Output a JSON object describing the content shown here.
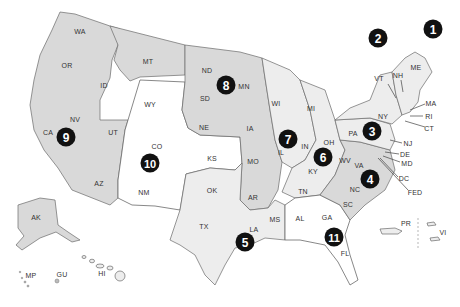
{
  "map": {
    "title": "",
    "colors": {
      "circuit_marker": "#111111",
      "shaded_region": "#d9d9d9",
      "light_region": "#ededed",
      "unshaded_region": "#ffffff"
    },
    "circuits": [
      {
        "id": "1",
        "label": "1",
        "x": 433,
        "y": 29
      },
      {
        "id": "2",
        "label": "2",
        "x": 378,
        "y": 38
      },
      {
        "id": "3",
        "label": "3",
        "x": 372,
        "y": 131
      },
      {
        "id": "4",
        "label": "4",
        "x": 370,
        "y": 179
      },
      {
        "id": "5",
        "label": "5",
        "x": 245,
        "y": 242
      },
      {
        "id": "6",
        "label": "6",
        "x": 323,
        "y": 157
      },
      {
        "id": "7",
        "label": "7",
        "x": 288,
        "y": 139
      },
      {
        "id": "8",
        "label": "8",
        "x": 226,
        "y": 85
      },
      {
        "id": "9",
        "label": "9",
        "x": 66,
        "y": 137
      },
      {
        "id": "10",
        "label": "10",
        "x": 150,
        "y": 163
      },
      {
        "id": "11",
        "label": "11",
        "x": 334,
        "y": 237
      }
    ],
    "states": [
      {
        "abbr": "WA",
        "x": 80,
        "y": 31
      },
      {
        "abbr": "OR",
        "x": 67,
        "y": 65
      },
      {
        "abbr": "CA",
        "x": 48,
        "y": 132
      },
      {
        "abbr": "NV",
        "x": 75,
        "y": 119
      },
      {
        "abbr": "ID",
        "x": 104,
        "y": 85
      },
      {
        "abbr": "MT",
        "x": 148,
        "y": 61
      },
      {
        "abbr": "WY",
        "x": 150,
        "y": 104
      },
      {
        "abbr": "UT",
        "x": 113,
        "y": 132
      },
      {
        "abbr": "CO",
        "x": 157,
        "y": 146
      },
      {
        "abbr": "AZ",
        "x": 99,
        "y": 183
      },
      {
        "abbr": "NM",
        "x": 144,
        "y": 192
      },
      {
        "abbr": "ND",
        "x": 207,
        "y": 70
      },
      {
        "abbr": "SD",
        "x": 205,
        "y": 98
      },
      {
        "abbr": "NE",
        "x": 204,
        "y": 127
      },
      {
        "abbr": "KS",
        "x": 212,
        "y": 158
      },
      {
        "abbr": "OK",
        "x": 212,
        "y": 190
      },
      {
        "abbr": "TX",
        "x": 204,
        "y": 226
      },
      {
        "abbr": "MN",
        "x": 244,
        "y": 86
      },
      {
        "abbr": "IA",
        "x": 250,
        "y": 128
      },
      {
        "abbr": "MO",
        "x": 253,
        "y": 161
      },
      {
        "abbr": "AR",
        "x": 253,
        "y": 197
      },
      {
        "abbr": "LA",
        "x": 254,
        "y": 229
      },
      {
        "abbr": "WI",
        "x": 276,
        "y": 103
      },
      {
        "abbr": "IL",
        "x": 281,
        "y": 152
      },
      {
        "abbr": "MI",
        "x": 311,
        "y": 108
      },
      {
        "abbr": "IN",
        "x": 305,
        "y": 146
      },
      {
        "abbr": "OH",
        "x": 329,
        "y": 142
      },
      {
        "abbr": "KY",
        "x": 313,
        "y": 171
      },
      {
        "abbr": "TN",
        "x": 303,
        "y": 191
      },
      {
        "abbr": "MS",
        "x": 275,
        "y": 219
      },
      {
        "abbr": "AL",
        "x": 300,
        "y": 218
      },
      {
        "abbr": "GA",
        "x": 327,
        "y": 217
      },
      {
        "abbr": "FL",
        "x": 345,
        "y": 253
      },
      {
        "abbr": "SC",
        "x": 348,
        "y": 204
      },
      {
        "abbr": "NC",
        "x": 355,
        "y": 189
      },
      {
        "abbr": "VA",
        "x": 359,
        "y": 165
      },
      {
        "abbr": "WV",
        "x": 345,
        "y": 160
      },
      {
        "abbr": "PA",
        "x": 353,
        "y": 133
      },
      {
        "abbr": "NY",
        "x": 383,
        "y": 116
      },
      {
        "abbr": "VT",
        "x": 379,
        "y": 78
      },
      {
        "abbr": "NH",
        "x": 398,
        "y": 75
      },
      {
        "abbr": "ME",
        "x": 416,
        "y": 67
      },
      {
        "abbr": "MA",
        "x": 431,
        "y": 103
      },
      {
        "abbr": "RI",
        "x": 429,
        "y": 116
      },
      {
        "abbr": "CT",
        "x": 429,
        "y": 128
      },
      {
        "abbr": "NJ",
        "x": 408,
        "y": 143
      },
      {
        "abbr": "DE",
        "x": 405,
        "y": 154
      },
      {
        "abbr": "MD",
        "x": 407,
        "y": 163
      },
      {
        "abbr": "DC",
        "x": 404,
        "y": 178
      },
      {
        "abbr": "FED",
        "x": 415,
        "y": 192
      },
      {
        "abbr": "AK",
        "x": 36,
        "y": 217
      },
      {
        "abbr": "HI",
        "x": 102,
        "y": 273
      },
      {
        "abbr": "MP",
        "x": 31,
        "y": 275
      },
      {
        "abbr": "GU",
        "x": 62,
        "y": 274
      },
      {
        "abbr": "PR",
        "x": 406,
        "y": 223
      },
      {
        "abbr": "VI",
        "x": 443,
        "y": 232
      }
    ]
  }
}
